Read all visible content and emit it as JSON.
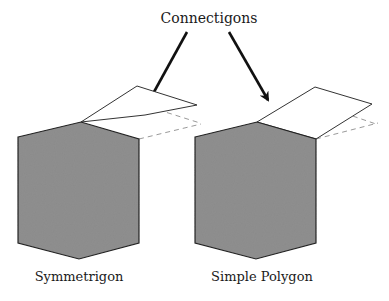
{
  "title": "Connectigons",
  "figures": [
    {
      "label": "Symmetrigon"
    },
    {
      "label": "Simple Polygon"
    }
  ],
  "colors": {
    "fill": "#8f8f8f",
    "stroke": "#222222",
    "dashed": "#9a9a9a",
    "background": "#ffffff"
  }
}
